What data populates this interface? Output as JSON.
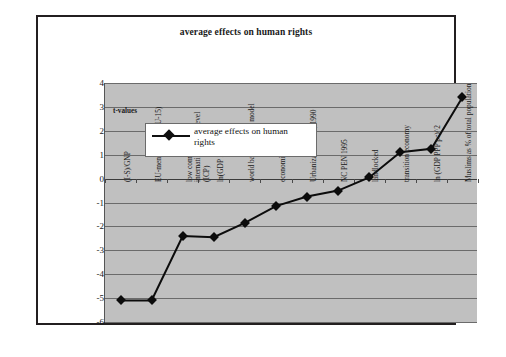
{
  "chart_data": {
    "type": "line",
    "title": "average effects on human rights",
    "xlabel": "",
    "ylabel": "t-values",
    "ylim": [
      -6,
      4
    ],
    "yticks": [
      4,
      3,
      2,
      1,
      0,
      -1,
      -2,
      -3,
      -4,
      -5,
      -6
    ],
    "grid": true,
    "legend_position": "top-left-inside",
    "legend": [
      "average effects on human rights"
    ],
    "annotations": [
      "t-values"
    ],
    "categories": [
      "(I-S)/GNP",
      "EU-membership (EU-15)",
      "low comparative international price level (ICP)",
      "ln(GDP PPP)",
      "world bank pension model",
      "economic freedom",
      "Urbanization ratio, 1990",
      "NC PEN 1995",
      "landlocked",
      "transition economy",
      "ln (GDP PPP pc)^2",
      "Muslims as % of total population"
    ],
    "series": [
      {
        "name": "average effects on human rights",
        "values": [
          -5.1,
          -5.1,
          -2.4,
          -2.45,
          -1.85,
          -1.15,
          -0.75,
          -0.5,
          0.05,
          1.1,
          1.25,
          3.4
        ]
      }
    ]
  },
  "colors": {
    "frame_border": "#231f20",
    "plot_background": "#c0c0c0",
    "gridline": "#6b6b6b",
    "series_line": "#0c0c0c",
    "page_background": "#ffffff",
    "text": "#1a1a1a"
  },
  "legend_text_lines": [
    "average effects on human",
    "rights"
  ]
}
